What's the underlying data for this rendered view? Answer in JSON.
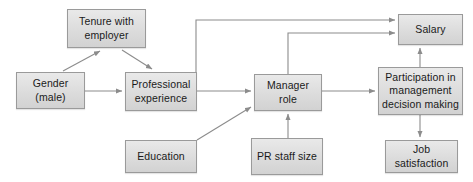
{
  "diagram": {
    "type": "path-diagram",
    "width": 473,
    "height": 182,
    "style": {
      "background": "#ffffff",
      "node_fill_top": "#e9e9e9",
      "node_fill_bottom": "#d2d2d2",
      "node_border": "#9a9a9a",
      "text_color": "#1a1a1a",
      "edge_color": "#8c8c8c"
    },
    "nodes": [
      {
        "id": "tenure",
        "label": "Tenure with employer",
        "lines": [
          "Tenure with",
          "employer"
        ],
        "x": 67,
        "y": 9,
        "w": 79,
        "h": 39
      },
      {
        "id": "gender",
        "label": "Gender (male)",
        "lines": [
          "Gender",
          "(male)"
        ],
        "x": 16,
        "y": 72,
        "w": 69,
        "h": 37
      },
      {
        "id": "professional",
        "label": "Professional experience",
        "lines": [
          "Professional",
          "experience"
        ],
        "x": 125,
        "y": 72,
        "w": 72,
        "h": 39
      },
      {
        "id": "education",
        "label": "Education",
        "lines": [
          "Education"
        ],
        "x": 125,
        "y": 140,
        "w": 72,
        "h": 33
      },
      {
        "id": "manager",
        "label": "Manager role",
        "lines": [
          "Manager",
          "role"
        ],
        "x": 254,
        "y": 74,
        "w": 68,
        "h": 37
      },
      {
        "id": "prstaff",
        "label": "PR staff size",
        "lines": [
          "PR staff",
          "size"
        ],
        "x": 251,
        "y": 138,
        "w": 72,
        "h": 37
      },
      {
        "id": "salary",
        "label": "Salary",
        "lines": [
          "Salary"
        ],
        "x": 398,
        "y": 14,
        "w": 65,
        "h": 31
      },
      {
        "id": "participation",
        "label": "Participation in management decision making",
        "lines": [
          "Participation",
          "in management",
          "decision making"
        ],
        "x": 378,
        "y": 67,
        "w": 85,
        "h": 48
      },
      {
        "id": "satisfaction",
        "label": "Job satisfaction",
        "lines": [
          "Job",
          "satisfaction"
        ],
        "x": 385,
        "y": 140,
        "w": 73,
        "h": 33
      }
    ],
    "edges": [
      {
        "from": "gender",
        "to": "tenure",
        "kind": "diagonal",
        "arrow": true
      },
      {
        "from": "tenure",
        "to": "professional",
        "kind": "diagonal",
        "arrow": true
      },
      {
        "from": "gender",
        "to": "professional",
        "kind": "horizontal",
        "arrow": true
      },
      {
        "from": "education",
        "to": "manager",
        "kind": "diagonal",
        "arrow": true
      },
      {
        "from": "professional",
        "to": "manager",
        "kind": "horizontal",
        "arrow": true
      },
      {
        "from": "prstaff",
        "to": "manager",
        "kind": "vertical",
        "arrow": true
      },
      {
        "from": "professional",
        "to": "salary",
        "kind": "orthogonal",
        "arrow": true
      },
      {
        "from": "manager",
        "to": "salary",
        "kind": "orthogonal",
        "arrow": true
      },
      {
        "from": "manager",
        "to": "participation",
        "kind": "horizontal",
        "arrow": true
      },
      {
        "from": "participation",
        "to": "salary",
        "kind": "vertical",
        "arrow": true
      },
      {
        "from": "participation",
        "to": "satisfaction",
        "kind": "vertical",
        "arrow": true
      }
    ]
  }
}
